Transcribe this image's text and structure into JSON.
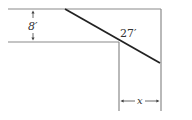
{
  "diagram": {
    "labels": {
      "corridor_width": "8′",
      "ladder_length": "27′",
      "unknown_width": "x"
    },
    "colors": {
      "wall": "#8a8a8a",
      "ladder": "#222222",
      "text": "#333333",
      "background": "#ffffff"
    }
  }
}
